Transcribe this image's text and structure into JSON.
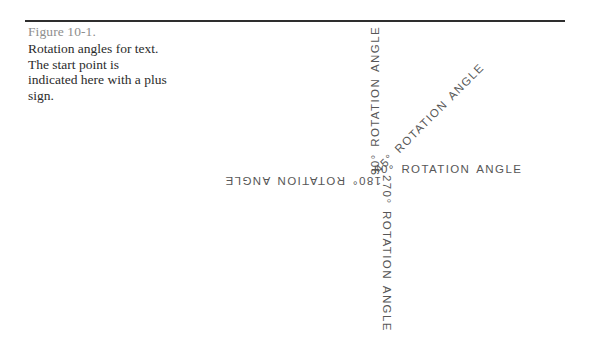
{
  "figure": {
    "number": "Figure 10-1.",
    "caption": "Rotation angles for text. The start point is indicated here with a plus sign."
  },
  "diagram": {
    "origin_marker": "+",
    "labels": [
      {
        "id": "deg0",
        "text": "0°  ROTATION  ANGLE",
        "angle_deg": 0,
        "css_rotation": "0deg"
      },
      {
        "id": "deg45",
        "text": "45°  ROTATION  ANGLE",
        "angle_deg": 45,
        "css_rotation": "-45deg"
      },
      {
        "id": "deg90",
        "text": "90°  ROTATION  ANGLE",
        "angle_deg": 90,
        "css_rotation": "-90deg"
      },
      {
        "id": "deg180",
        "text": "180°  ROTATION  ANGLE",
        "angle_deg": 180,
        "css_rotation": "180deg"
      },
      {
        "id": "deg270",
        "text": "270°  ROTATION  ANGLE",
        "angle_deg": 270,
        "css_rotation": "90deg"
      }
    ]
  },
  "colors": {
    "page_background": "#ffffff",
    "rule": "#2e2e2e",
    "figure_number_text": "#8e8e8e",
    "caption_text": "#2b2b2b",
    "diagram_text": "#575757"
  }
}
